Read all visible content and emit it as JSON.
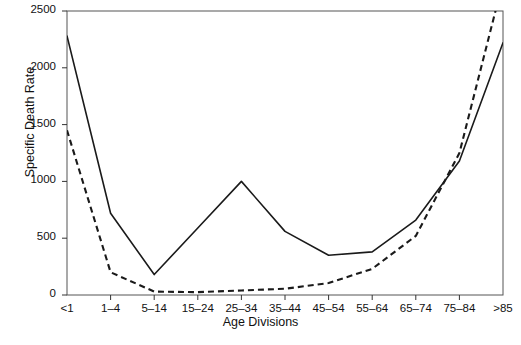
{
  "chart_data": {
    "type": "line",
    "title": "",
    "xlabel": "Age Divisions",
    "ylabel": "Specific Death Rate",
    "categories": [
      "<1",
      "1–4",
      "5–14",
      "15–24",
      "25–34",
      "35–44",
      "45–54",
      "55–64",
      "65–74",
      "75–84",
      ">85"
    ],
    "ylim": [
      0,
      2500
    ],
    "yticks": [
      0,
      500,
      1000,
      1500,
      2000,
      2500
    ],
    "ytick_labels": [
      "0",
      "500",
      "1000",
      "1500",
      "2000",
      "2500"
    ],
    "grid": false,
    "legend": "none",
    "series": [
      {
        "name": "solid",
        "style": "solid",
        "color": "#1a1a1a",
        "values": [
          2280,
          720,
          180,
          590,
          1000,
          560,
          350,
          380,
          660,
          1180,
          2220
        ]
      },
      {
        "name": "dashed",
        "style": "dashed",
        "color": "#1a1a1a",
        "values": [
          1450,
          200,
          30,
          25,
          40,
          55,
          105,
          230,
          520,
          1250,
          2760
        ],
        "note": "exceeds upper axis limit at >85; clipped by plot frame"
      }
    ]
  },
  "axis": {
    "x_title": "Age Divisions",
    "y_title": "Specific Death Rate"
  }
}
